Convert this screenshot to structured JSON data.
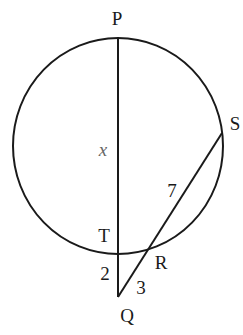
{
  "diagram": {
    "type": "circle-secant-secant",
    "colors": {
      "stroke": "#1a1a1a",
      "variable": "#666666",
      "background": "#ffffff"
    },
    "points": {
      "P": {
        "label": "P"
      },
      "S": {
        "label": "S"
      },
      "T": {
        "label": "T"
      },
      "R": {
        "label": "R"
      },
      "Q": {
        "label": "Q"
      }
    },
    "segments": {
      "PT": {
        "label": "x"
      },
      "RS": {
        "label": "7"
      },
      "TQ": {
        "label": "2"
      },
      "RQ": {
        "label": "3"
      }
    }
  }
}
